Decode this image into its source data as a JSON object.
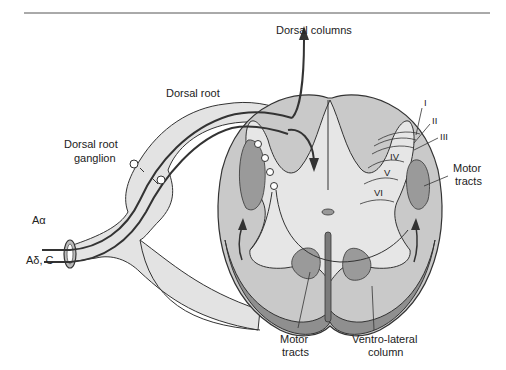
{
  "diagram": {
    "labels": {
      "dorsal_columns": "Dorsal columns",
      "dorsal_root": "Dorsal root",
      "dorsal_root_ganglion_1": "Dorsal root",
      "dorsal_root_ganglion_2": "ganglion",
      "a_alpha": "Aα",
      "a_delta_c": "Aδ, C",
      "motor_tracts_right_1": "Motor",
      "motor_tracts_right_2": "tracts",
      "motor_tracts_bottom_1": "Motor",
      "motor_tracts_bottom_2": "tracts",
      "ventrolateral_1": "Ventro-lateral",
      "ventrolateral_2": "column"
    },
    "laminae": [
      "I",
      "II",
      "III",
      "IV",
      "V",
      "VI"
    ],
    "colors": {
      "white_matter": "#c9c9c9",
      "gray_matter": "#e6e6e6",
      "tract": "#9a9a9a",
      "outline": "#333333",
      "nerve": "#e0e0e0"
    }
  }
}
